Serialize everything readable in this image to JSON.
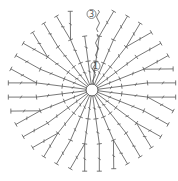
{
  "diagram": {
    "type": "crochet-round-chart",
    "center": {
      "x": 92,
      "y": 90,
      "ring_radius": 6
    },
    "round_labels": [
      {
        "text": "1",
        "x": 93,
        "y": 66
      },
      {
        "text": "3",
        "x": 89,
        "y": 14
      }
    ],
    "rounds": 3,
    "stitches_per_round": [
      12,
      24,
      36
    ],
    "ink_color": "#555555"
  }
}
